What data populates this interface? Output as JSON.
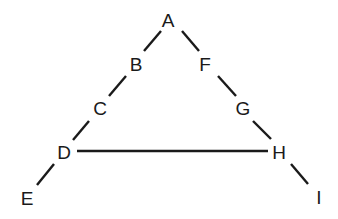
{
  "diagram": {
    "type": "graph",
    "nodes": [
      {
        "id": "A",
        "label": "A",
        "x": 168,
        "y": 20
      },
      {
        "id": "B",
        "label": "B",
        "x": 136,
        "y": 64
      },
      {
        "id": "C",
        "label": "C",
        "x": 100,
        "y": 108
      },
      {
        "id": "D",
        "label": "D",
        "x": 64,
        "y": 152
      },
      {
        "id": "E",
        "label": "E",
        "x": 27,
        "y": 198
      },
      {
        "id": "F",
        "label": "F",
        "x": 205,
        "y": 64
      },
      {
        "id": "G",
        "label": "G",
        "x": 243,
        "y": 108
      },
      {
        "id": "H",
        "label": "H",
        "x": 279,
        "y": 152
      },
      {
        "id": "I",
        "label": "I",
        "x": 319,
        "y": 197
      }
    ],
    "edges": [
      {
        "from": "A",
        "to": "B",
        "x1": 161,
        "y1": 31,
        "x2": 144,
        "y2": 51
      },
      {
        "from": "B",
        "to": "C",
        "x1": 126,
        "y1": 76,
        "x2": 109,
        "y2": 96
      },
      {
        "from": "C",
        "to": "D",
        "x1": 89,
        "y1": 121,
        "x2": 73,
        "y2": 140
      },
      {
        "from": "D",
        "to": "E",
        "x1": 54,
        "y1": 164,
        "x2": 37,
        "y2": 185
      },
      {
        "from": "A",
        "to": "F",
        "x1": 182,
        "y1": 31,
        "x2": 199,
        "y2": 51
      },
      {
        "from": "F",
        "to": "G",
        "x1": 218,
        "y1": 76,
        "x2": 236,
        "y2": 96
      },
      {
        "from": "G",
        "to": "H",
        "x1": 253,
        "y1": 121,
        "x2": 271,
        "y2": 139
      },
      {
        "from": "H",
        "to": "I",
        "x1": 291,
        "y1": 164,
        "x2": 308,
        "y2": 184
      },
      {
        "from": "D",
        "to": "H",
        "x1": 77,
        "y1": 151,
        "x2": 268,
        "y2": 151
      }
    ]
  }
}
